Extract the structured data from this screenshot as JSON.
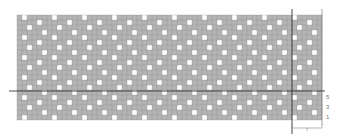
{
  "figure": {
    "type": "knitting-chart",
    "grid": {
      "columns": 61,
      "rows": 21,
      "cell_size_px": 5,
      "filled_color": "#b4b4b4",
      "empty_color": "#ffffff",
      "gridline_color": "#8c8c8c",
      "pattern_repeat": {
        "width": 6,
        "height": 4
      }
    },
    "row_labels": [
      "5",
      "3",
      "1"
    ],
    "repeat_bracket_label": "",
    "colors": {
      "marker_line": "#333333",
      "text": "#777777"
    }
  }
}
